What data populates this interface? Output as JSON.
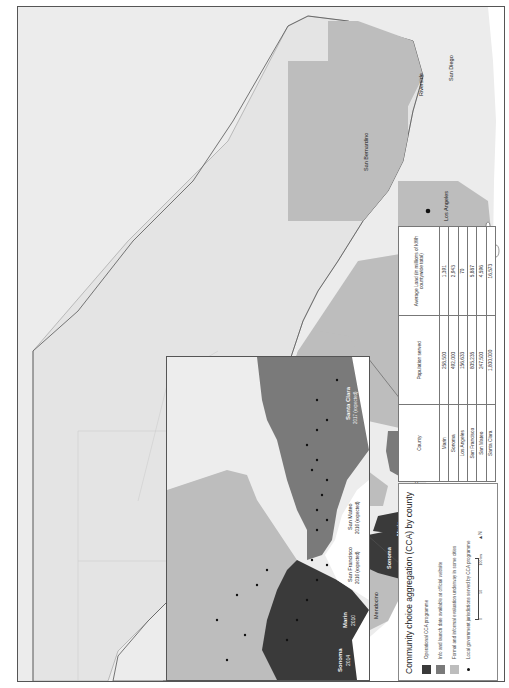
{
  "figure": {
    "orientation": "rotated-90-ccw",
    "colors": {
      "operational": "#3a3a3a",
      "launch_date": "#7a7a7a",
      "formal_evaluation": "#bdbdbd",
      "land_default": "#e6e6e6",
      "land_light": "#ededed",
      "water": "#ffffff",
      "dot": "#111111"
    }
  },
  "main_map": {
    "counties": [
      {
        "name": "Humboldt",
        "status": "formal_evaluation"
      },
      {
        "name": "Mendocino",
        "status": "formal_evaluation"
      },
      {
        "name": "Lake",
        "status": "formal_evaluation"
      },
      {
        "name": "Sonoma",
        "status": "operational"
      },
      {
        "name": "Napa",
        "status": "formal_evaluation"
      },
      {
        "name": "Yolo",
        "status": "formal_evaluation"
      },
      {
        "name": "Solano",
        "status": "formal_evaluation"
      },
      {
        "name": "Marin",
        "status": "operational"
      },
      {
        "name": "Contra Costa",
        "status": "formal_evaluation"
      },
      {
        "name": "San Francisco",
        "status": "launch_date"
      },
      {
        "name": "San Mateo",
        "status": "launch_date"
      },
      {
        "name": "Santa Clara",
        "status": "launch_date"
      },
      {
        "name": "Santa Cruz",
        "status": "launch_date"
      },
      {
        "name": "San Benito",
        "status": "formal_evaluation"
      },
      {
        "name": "Monterey",
        "status": "formal_evaluation"
      },
      {
        "name": "Fresno",
        "status": "formal_evaluation"
      },
      {
        "name": "San Luis Obispo",
        "status": "formal_evaluation"
      },
      {
        "name": "Santa Barbara",
        "status": "formal_evaluation"
      },
      {
        "name": "Ventura",
        "status": "formal_evaluation"
      },
      {
        "name": "Los Angeles",
        "status": "formal_evaluation"
      },
      {
        "name": "San Bernardino",
        "status": "formal_evaluation"
      },
      {
        "name": "Riverside",
        "status": "formal_evaluation"
      },
      {
        "name": "San Diego",
        "status": "formal_evaluation"
      }
    ]
  },
  "inset_map": {
    "labels": [
      {
        "name": "Sonoma",
        "year": "2014"
      },
      {
        "name": "Marin",
        "year": "2010"
      },
      {
        "name": "San Francisco",
        "year": "2016 (expected)"
      },
      {
        "name": "San Mateo",
        "year": "2016 (expected)"
      },
      {
        "name": "Santa Clara",
        "year": "2017 (expected)"
      }
    ]
  },
  "legend": {
    "title": "Community choice aggregation (CCA) by county",
    "items": [
      {
        "label": "Operational CCA programme",
        "key": "operational"
      },
      {
        "label": "Info and launch date available at official website",
        "key": "launch_date"
      },
      {
        "label": "Formal and informal evaluation underway in some cities",
        "key": "formal_evaluation"
      },
      {
        "label": "Local government jurisdictions served by CCA programme",
        "key": "dot"
      }
    ],
    "scale": {
      "ticks": [
        "0",
        "50",
        "100 km"
      ]
    },
    "north_label": "N"
  },
  "table": {
    "headers": [
      "County",
      "Population served",
      "Average Load (in millions of kWh countywide total)"
    ],
    "rows": [
      {
        "county": "Marin",
        "population": "258,500",
        "load": "1,391"
      },
      {
        "county": "Sonoma",
        "population": "492,000",
        "load": "2,943"
      },
      {
        "county": "Los Angeles",
        "population": "156,633",
        "load": "70"
      },
      {
        "county": "San Francisco",
        "population": "805,235",
        "load": "5,887"
      },
      {
        "county": "San Mateo",
        "population": "247,500",
        "load": "4,596"
      },
      {
        "county": "Santa Clara",
        "population": "1,800,000",
        "load": "16,573"
      }
    ]
  }
}
